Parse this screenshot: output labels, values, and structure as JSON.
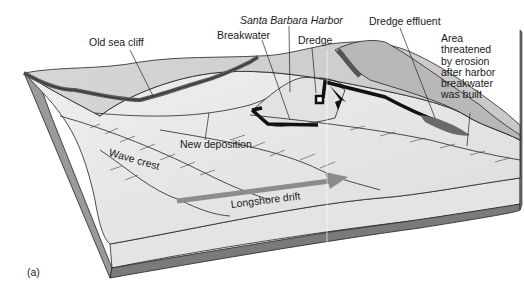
{
  "figure": {
    "panel_label": "(a)",
    "title": "Santa Barbara Harbor",
    "labels": {
      "old_sea_cliff": "Old sea cliff",
      "breakwater": "Breakwater",
      "santa_barbara_harbor": "Santa Barbara Harbor",
      "dredge": "Dredge",
      "dredge_effluent": "Dredge effluent",
      "area_threatened": "Area\nthreatened\nby erosion\nafter harbor\nbreakwater\nwas built",
      "new_deposition": "New deposition",
      "wave_crest": "Wave crest",
      "longshore_drift": "Longshore drift"
    }
  },
  "colors": {
    "land_top": "#d9d9d9",
    "cliff_face": "#8a8a8a",
    "sea_surface": "#ececec",
    "block_side": "#e6e6e6",
    "block_base": "#7a7a7a",
    "drift_arrow": "#8c8c8c",
    "outline": "#222222"
  }
}
